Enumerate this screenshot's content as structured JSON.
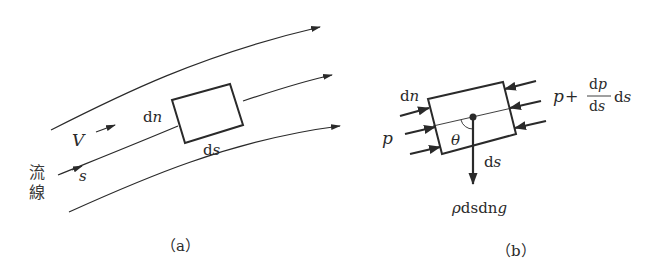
{
  "figure": {
    "panel_a": {
      "caption": "（a）",
      "labels": {
        "dn": "d",
        "dn_var": "n",
        "ds": "d",
        "ds_var": "s",
        "velocity": "V",
        "s": "s",
        "streamline_1": "流",
        "streamline_2": "線"
      },
      "streamline_count": 3
    },
    "panel_b": {
      "caption": "（b）",
      "labels": {
        "dn": "d",
        "dn_var": "n",
        "p": "p",
        "theta": "θ",
        "ds": "d",
        "ds_var": "s",
        "weight_rho": "ρ",
        "weight_ds": "ds",
        "weight_dn": "dn",
        "weight_g": "g",
        "downstream_p": "p",
        "plus": "+",
        "frac_num_d": "d",
        "frac_num_p": "p",
        "frac_den_d": "d",
        "frac_den_s": "s",
        "tail_d": "d",
        "tail_s": "s"
      },
      "left_pressure_arrows": 3,
      "right_pressure_arrows": 3
    },
    "colors": {
      "ink": "#2a2a2a",
      "background": "#ffffff"
    }
  }
}
